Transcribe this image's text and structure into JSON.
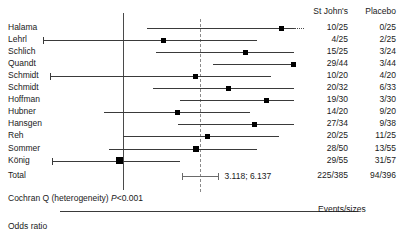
{
  "figure": {
    "axis_title": "Odds ratio",
    "heterogeneity_prefix": "Cochran Q (heterogeneity) ",
    "heterogeneity_stat": "P",
    "heterogeneity_value": "<0.001",
    "footer_note": "Events/sizes",
    "total_label": "Total",
    "total_ci_label": "3.118; 6.137"
  },
  "columns": {
    "treatment_header": "St John's",
    "control_header": "Placebo"
  },
  "axis": {
    "tick_labels": [
      "1.0",
      "10",
      "30",
      "80"
    ],
    "tick_values": [
      1.0,
      10,
      30,
      80
    ],
    "scale": "log",
    "xmin": 0.22,
    "xmax": 95
  },
  "chart_data": {
    "type": "forest",
    "title": "",
    "xlabel": "Odds ratio",
    "ylabel": "",
    "xscale": "log",
    "xlim": [
      0.22,
      95
    ],
    "grid": false,
    "null_line": 1.0,
    "summary_line": 4.374,
    "legend": [
      "St John's",
      "Placebo"
    ],
    "studies": [
      {
        "label": "Halama",
        "treatment": "10/25",
        "control": "0/25",
        "or": 21.0,
        "ci_low": 1.6,
        "ci_high": 95.0,
        "open_right": true,
        "weight": 0.3
      },
      {
        "label": "Lehrl",
        "treatment": "4/25",
        "control": "2/25",
        "or": 2.19,
        "ci_low": 0.22,
        "ci_high": 13.0,
        "open_left": true,
        "weight": 0.3
      },
      {
        "label": "Schlich",
        "treatment": "15/25",
        "control": "3/24",
        "or": 10.5,
        "ci_low": 1.9,
        "ci_high": 46.0,
        "weight": 0.32
      },
      {
        "label": "Quandt",
        "treatment": "29/44",
        "control": "3/44",
        "or": 26.4,
        "ci_low": 5.6,
        "ci_high": 92.0,
        "weight": 0.34
      },
      {
        "label": "Schmidt",
        "treatment": "10/20",
        "control": "4/20",
        "or": 4.0,
        "ci_low": 0.25,
        "ci_high": 17.0,
        "open_left": true,
        "weight": 0.3
      },
      {
        "label": "Schmidt",
        "treatment": "20/32",
        "control": "6/33",
        "or": 7.5,
        "ci_low": 1.8,
        "ci_high": 27.0,
        "weight": 0.34
      },
      {
        "label": "Hoffman",
        "treatment": "19/30",
        "control": "3/30",
        "or": 15.5,
        "ci_low": 3.0,
        "ci_high": 60.0,
        "weight": 0.33
      },
      {
        "label": "Hubner",
        "treatment": "14/20",
        "control": "9/20",
        "or": 2.85,
        "ci_low": 0.7,
        "ci_high": 11.5,
        "weight": 0.33
      },
      {
        "label": "Hansgen",
        "treatment": "27/34",
        "control": "9/38",
        "or": 12.4,
        "ci_low": 2.9,
        "ci_high": 48.0,
        "weight": 0.36
      },
      {
        "label": "Reh",
        "treatment": "20/25",
        "control": "11/25",
        "or": 5.1,
        "ci_low": 1.0,
        "ci_high": 20.0,
        "weight": 0.3
      },
      {
        "label": "Sommer",
        "treatment": "28/50",
        "control": "13/55",
        "or": 4.1,
        "ci_low": 0.78,
        "ci_high": 13.0,
        "weight": 0.44
      },
      {
        "label": "König",
        "treatment": "29/55",
        "control": "31/57",
        "or": 0.94,
        "ci_low": 0.26,
        "ci_high": 3.0,
        "open_left": true,
        "weight": 0.72
      }
    ],
    "total": {
      "label": "Total",
      "treatment": "225/385",
      "control": "94/396",
      "or": 4.374,
      "ci_low": 3.118,
      "ci_high": 6.137,
      "ci_text": "3.118; 6.137"
    }
  },
  "colors": {
    "marker": "#000000",
    "line": "#3a3a3a",
    "null_line": "#4a4a4a",
    "summary_line": "#8a8a8a",
    "text": "#1a1a1a"
  }
}
